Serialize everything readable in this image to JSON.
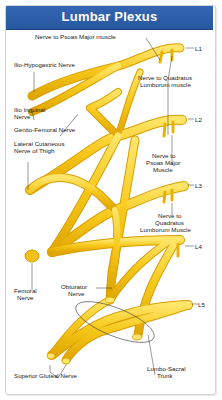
{
  "header": {
    "title": "Lumbar Plexus"
  },
  "colors": {
    "header_bg": "#2F5FAA",
    "nerve": "#F5C518",
    "nerve_highlight": "#FFE56A",
    "nerve_shade": "#DDA300"
  },
  "roots": [
    "L1",
    "L2",
    "L3",
    "L4",
    "L5"
  ],
  "labels": {
    "psoas_major_l1": "Nerve to Psoas Major muscle",
    "ilio_hypogastric": "Ilio-Hypogastric Nerve",
    "quadratus_l1_line1": "Nerve to Quadratus",
    "quadratus_l1_line2": "Lumborum muscle",
    "ilio_inguinal_line1": "Ilio Inguinal",
    "ilio_inguinal_line2": "Nerve",
    "genito_femoral": "Genito-Femoral Nerve",
    "lateral_cutaneous_line1": "Lateral Cutaneous",
    "lateral_cutaneous_line2": "Nerve of Thigh",
    "psoas_major_l2_line1": "Nerve to",
    "psoas_major_l2_line2": "Psoas Major",
    "psoas_major_l2_line3": "Muscle",
    "quadratus_l3_line1": "Nerve to",
    "quadratus_l3_line2": "Quadratus",
    "quadratus_l3_line3": "Lumborum Muscle",
    "femoral_line1": "Femoral",
    "femoral_line2": "Nerve",
    "obturator_line1": "Obturator",
    "obturator_line2": "Nerve",
    "superior_gluteal": "Superior Gluteal Nerve",
    "lumbosacral_line1": "Lumbo-Sacral",
    "lumbosacral_line2": "Trunk"
  }
}
